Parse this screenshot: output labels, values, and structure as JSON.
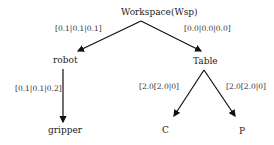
{
  "diagram": {
    "type": "tree",
    "nodes": {
      "root": {
        "label": "Workspace(Wsp)"
      },
      "robot": {
        "label": "robot"
      },
      "table": {
        "label": "Table"
      },
      "gripper": {
        "label": "gripper"
      },
      "c": {
        "label": "C"
      },
      "p": {
        "label": "P"
      }
    },
    "edges": [
      {
        "from": "root",
        "to": "robot",
        "label": "[0.1|0.1|0.1]"
      },
      {
        "from": "root",
        "to": "table",
        "label": "[0.0|0.0|0.0]"
      },
      {
        "from": "robot",
        "to": "gripper",
        "label": "[0.1|0.1|0.2]"
      },
      {
        "from": "table",
        "to": "c",
        "label": "[2.0[2.0|0]"
      },
      {
        "from": "table",
        "to": "p",
        "label": "[2.0[2.0|0]"
      }
    ],
    "colors": {
      "line": "#111111",
      "text": "#222222",
      "background": "#ffffff"
    }
  }
}
